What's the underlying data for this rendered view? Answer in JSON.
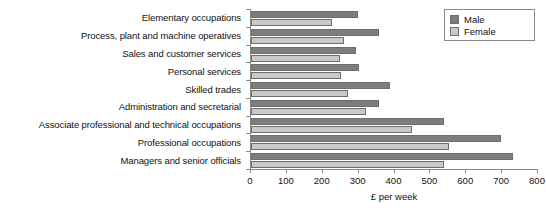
{
  "chart_data": {
    "type": "bar",
    "orientation": "horizontal",
    "title": "",
    "xlabel": "£ per week",
    "ylabel": "",
    "xlim": [
      0,
      800
    ],
    "xticks": [
      0,
      100,
      200,
      300,
      400,
      500,
      600,
      700,
      800
    ],
    "grid": false,
    "legend_position": "top-right",
    "categories": [
      "Elementary occupations",
      "Process, plant and machine operatives",
      "Sales and customer services",
      "Personal services",
      "Skilled trades",
      "Administration and secretarial",
      "Associate professional and technical occupations",
      "Professional occupations",
      "Managers and senior officials"
    ],
    "series": [
      {
        "name": "Male",
        "color": "#7d7d7d",
        "values": [
          298,
          357,
          293,
          301,
          387,
          357,
          538,
          696,
          730
        ]
      },
      {
        "name": "Female",
        "color": "#c9c9c9",
        "values": [
          226,
          259,
          248,
          251,
          270,
          320,
          448,
          552,
          538
        ]
      }
    ]
  },
  "legend": {
    "items": [
      {
        "label": "Male"
      },
      {
        "label": "Female"
      }
    ]
  },
  "axis": {
    "x_title": "£ per week"
  }
}
